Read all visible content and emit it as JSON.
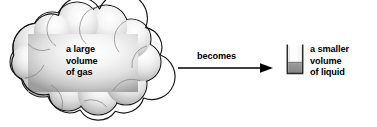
{
  "diagram": {
    "title": "a large volume of gas becomes a smaller volume of liquid",
    "background_color": "#ffffff",
    "text_color": "#000000",
    "outline_color": "#000000"
  },
  "cloud": {
    "label_line1": "a large",
    "label_line2": "volume",
    "label_line3": "of gas",
    "icon_name": "cloud-shape",
    "fill_light": "#ffffff",
    "fill_mid": "#dcdcdc",
    "fill_dark": "#9a9a9a",
    "stroke": "#1a1a1a"
  },
  "arrow": {
    "label": "becomes",
    "icon_name": "right-arrow",
    "color": "#000000",
    "x_start": 178,
    "x_end": 273,
    "y": 68
  },
  "beaker": {
    "label_line1": "a smaller",
    "label_line2": "volume",
    "label_line3": "of liquid",
    "icon_name": "beaker-with-liquid",
    "glass_stroke": "#2a2a2a",
    "liquid_fill": "#8c8c8c",
    "liquid_top": "#a8a8a8"
  }
}
